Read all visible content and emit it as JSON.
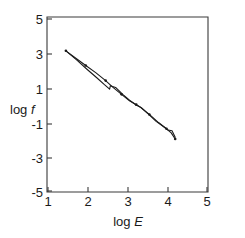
{
  "chart_data": {
    "type": "line",
    "title": "",
    "subtitle": "",
    "xlabel": "log E",
    "xlabel_text": "log",
    "xlabel_italic": "E",
    "ylabel": "log f",
    "ylabel_text": "log",
    "ylabel_italic": "f",
    "xlim": [
      1,
      5
    ],
    "ylim": [
      -5,
      5
    ],
    "xticks": [
      1,
      2,
      3,
      4,
      5
    ],
    "xtick_labels": [
      "1",
      "2",
      "3",
      "4",
      "5"
    ],
    "yticks": [
      -5,
      -3,
      -1,
      1,
      3,
      5
    ],
    "ytick_labels": [
      "-5",
      "-3",
      "-1",
      "1",
      "3",
      "5"
    ],
    "grid": false,
    "legend": null,
    "legend_position": "none",
    "axis_color": "#3a3a3a",
    "line_color": "#1a1a1a",
    "series": [
      {
        "name": "model-curve-with-markers",
        "style": "line-with-dot-markers",
        "markers": true,
        "points": [
          [
            1.45,
            3.15
          ],
          [
            1.7,
            2.72
          ],
          [
            1.95,
            2.3
          ],
          [
            2.2,
            1.88
          ],
          [
            2.45,
            1.42
          ],
          [
            2.62,
            1.05
          ],
          [
            2.85,
            0.62
          ],
          [
            3.05,
            0.25
          ],
          [
            3.22,
            0.02
          ],
          [
            3.32,
            -0.12
          ],
          [
            3.55,
            -0.55
          ],
          [
            3.78,
            -1.02
          ],
          [
            3.98,
            -1.38
          ],
          [
            4.1,
            -1.62
          ],
          [
            4.2,
            -1.98
          ]
        ]
      },
      {
        "name": "observed-curve-solid",
        "style": "solid-line",
        "markers": false,
        "points": [
          [
            1.45,
            3.15
          ],
          [
            1.72,
            2.62
          ],
          [
            1.98,
            2.08
          ],
          [
            2.22,
            1.6
          ],
          [
            2.42,
            1.18
          ],
          [
            2.55,
            0.92
          ],
          [
            2.57,
            1.12
          ],
          [
            2.7,
            1.02
          ],
          [
            2.88,
            0.62
          ],
          [
            3.05,
            0.28
          ],
          [
            3.22,
            0.0
          ],
          [
            3.35,
            -0.16
          ],
          [
            3.52,
            -0.52
          ],
          [
            3.72,
            -0.95
          ],
          [
            3.92,
            -1.28
          ],
          [
            4.02,
            -1.45
          ],
          [
            4.12,
            -1.5
          ],
          [
            4.2,
            -1.88
          ]
        ]
      }
    ]
  },
  "figure": {
    "background_color": "#ffffff",
    "marker_radius": 1.3
  }
}
